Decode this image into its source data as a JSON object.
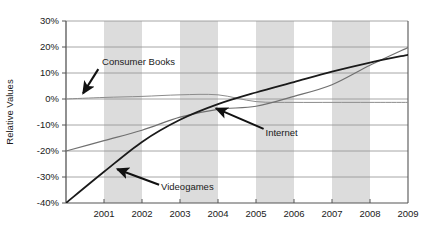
{
  "chart_data": {
    "type": "line",
    "title": "",
    "subtitle": "",
    "xlabel": "",
    "ylabel": "Relative Values",
    "xlim": [
      2000,
      2009
    ],
    "ylim": [
      -40,
      30
    ],
    "x_tick_labels": [
      "2001",
      "2002",
      "2003",
      "2004",
      "2005",
      "2006",
      "2007",
      "2008",
      "2009"
    ],
    "x_ticks": [
      2001,
      2002,
      2003,
      2004,
      2005,
      2006,
      2007,
      2008,
      2009
    ],
    "y_tick_labels": [
      "30%",
      "20%",
      "10%",
      "0%",
      "-10%",
      "-20%",
      "-30%",
      "-40%"
    ],
    "y_ticks": [
      30,
      20,
      10,
      0,
      -10,
      -20,
      -30,
      -40
    ],
    "grid": "horizontal",
    "legend_position": "inline-annotations",
    "shaded_bands": [
      {
        "from": 2001,
        "to": 2002
      },
      {
        "from": 2003,
        "to": 2004
      },
      {
        "from": 2005,
        "to": 2006
      },
      {
        "from": 2007,
        "to": 2008
      }
    ],
    "band_color": "#dcdcdc",
    "x": [
      2000,
      2001,
      2002,
      2003,
      2004,
      2005,
      2006,
      2007,
      2008,
      2009
    ],
    "series": [
      {
        "name": "Consumer Books",
        "color": "#8c8c8c",
        "width": 1,
        "values": [
          0.0,
          0.6,
          1.0,
          1.6,
          1.6,
          -1.0,
          -1.3,
          -1.3,
          -1.3,
          -1.3
        ]
      },
      {
        "name": "Internet",
        "color": "#707070",
        "width": 1.2,
        "values": [
          -20.0,
          -16.0,
          -12.0,
          -7.0,
          -4.0,
          -2.8,
          1.0,
          5.5,
          13.0,
          19.8
        ]
      },
      {
        "name": "Videogames",
        "color": "#1a1a1a",
        "width": 1.8,
        "values": [
          -40.0,
          -28.0,
          -16.5,
          -8.0,
          -2.0,
          2.5,
          6.5,
          10.5,
          14.0,
          17.0
        ]
      }
    ],
    "annotations": [
      {
        "label": "Consumer Books",
        "label_x": 2000.95,
        "label_y": 14.5,
        "arrow_from_x": 2000.85,
        "arrow_from_y": 11.5,
        "arrow_to_x": 2000.45,
        "arrow_to_y": 2.2
      },
      {
        "label": "Internet",
        "label_x": 2005.25,
        "label_y": -12.8,
        "arrow_from_x": 2005.2,
        "arrow_from_y": -11.5,
        "arrow_to_x": 2003.95,
        "arrow_to_y": -3.6
      },
      {
        "label": "Videogames",
        "label_x": 2002.5,
        "label_y": -33.6,
        "arrow_from_x": 2002.45,
        "arrow_from_y": -33.0,
        "arrow_to_x": 2001.35,
        "arrow_to_y": -27.0
      }
    ]
  }
}
